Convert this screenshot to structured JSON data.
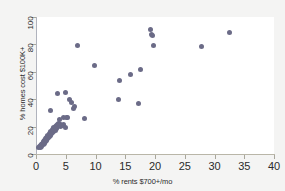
{
  "figure": {
    "background_color": "#f4f4f3",
    "panel_color": "#ffffff",
    "marker_color": "#6b6b87",
    "axis_color": "#b0b3bd"
  },
  "chart_data": {
    "type": "scatter",
    "title": "",
    "xlabel": "% rents $700+/mo",
    "ylabel": "% homes cost $100K+",
    "xlim": [
      0,
      40
    ],
    "ylim": [
      0,
      100
    ],
    "xticks": [
      0,
      5,
      10,
      15,
      20,
      25,
      30,
      35,
      40
    ],
    "yticks": [
      0,
      20,
      40,
      60,
      80,
      100
    ],
    "grid": false,
    "legend": null,
    "marker": "filled-circle",
    "points": [
      [
        0.5,
        4.5
      ],
      [
        0.6,
        5.2
      ],
      [
        0.7,
        6.0
      ],
      [
        0.8,
        5.0
      ],
      [
        0.9,
        6.8
      ],
      [
        1.0,
        7.2
      ],
      [
        1.0,
        5.8
      ],
      [
        1.1,
        8.0
      ],
      [
        1.2,
        7.0
      ],
      [
        1.2,
        9.0
      ],
      [
        1.3,
        8.5
      ],
      [
        1.4,
        9.6
      ],
      [
        1.4,
        7.5
      ],
      [
        1.5,
        10.2
      ],
      [
        1.5,
        8.8
      ],
      [
        1.6,
        11.0
      ],
      [
        1.6,
        9.4
      ],
      [
        1.7,
        10.5
      ],
      [
        1.8,
        12.0
      ],
      [
        1.8,
        10.0
      ],
      [
        1.9,
        12.8
      ],
      [
        2.0,
        11.5
      ],
      [
        2.0,
        13.5
      ],
      [
        2.1,
        12.2
      ],
      [
        2.2,
        14.0
      ],
      [
        2.2,
        12.6
      ],
      [
        2.3,
        15.0
      ],
      [
        2.4,
        13.8
      ],
      [
        2.4,
        15.8
      ],
      [
        2.5,
        14.5
      ],
      [
        2.5,
        16.5
      ],
      [
        2.6,
        15.2
      ],
      [
        2.7,
        17.0
      ],
      [
        2.7,
        15.6
      ],
      [
        2.8,
        17.8
      ],
      [
        2.9,
        16.4
      ],
      [
        2.9,
        18.5
      ],
      [
        3.0,
        17.2
      ],
      [
        3.0,
        19.0
      ],
      [
        3.1,
        18.0
      ],
      [
        3.2,
        19.5
      ],
      [
        3.2,
        17.5
      ],
      [
        3.3,
        20.2
      ],
      [
        3.4,
        18.8
      ],
      [
        3.4,
        20.8
      ],
      [
        3.5,
        19.6
      ],
      [
        3.6,
        21.4
      ],
      [
        3.6,
        20.0
      ],
      [
        3.7,
        22.0
      ],
      [
        3.8,
        20.6
      ],
      [
        3.9,
        21.0
      ],
      [
        4.0,
        21.8
      ],
      [
        4.1,
        20.4
      ],
      [
        4.2,
        21.5
      ],
      [
        4.4,
        20.8
      ],
      [
        4.6,
        21.2
      ],
      [
        2.4,
        32.0
      ],
      [
        3.6,
        44.5
      ],
      [
        3.9,
        25.5
      ],
      [
        4.6,
        26.5
      ],
      [
        4.9,
        44.8
      ],
      [
        4.9,
        19.2
      ],
      [
        5.2,
        27.0
      ],
      [
        5.3,
        26.8
      ],
      [
        5.6,
        40.0
      ],
      [
        6.0,
        37.8
      ],
      [
        6.3,
        33.5
      ],
      [
        6.5,
        35.0
      ],
      [
        6.9,
        79.2
      ],
      [
        8.1,
        26.0
      ],
      [
        9.9,
        64.8
      ],
      [
        13.9,
        39.5
      ],
      [
        14.0,
        54.0
      ],
      [
        15.9,
        57.8
      ],
      [
        17.2,
        37.0
      ],
      [
        17.6,
        61.5
      ],
      [
        19.2,
        91.0
      ],
      [
        19.4,
        87.5
      ],
      [
        19.6,
        86.8
      ],
      [
        19.7,
        79.0
      ],
      [
        27.8,
        78.5
      ],
      [
        32.5,
        88.8
      ]
    ]
  },
  "axes": {
    "xtick_labels": [
      "0",
      "5",
      "10",
      "15",
      "20",
      "25",
      "30",
      "35",
      "40"
    ],
    "ytick_labels": [
      "0",
      "20",
      "40",
      "60",
      "80",
      "100"
    ]
  }
}
